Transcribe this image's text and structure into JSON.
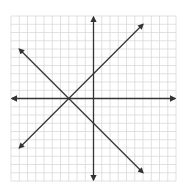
{
  "chart_data": {
    "type": "line",
    "title": "",
    "xlabel": "",
    "ylabel": "",
    "xlim": [
      -10,
      10
    ],
    "ylim": [
      -10,
      10
    ],
    "grid": true,
    "grid_step": 1,
    "axes_arrows": true,
    "series": [
      {
        "name": "line-1",
        "equation": "y = x + 3",
        "x": [
          -9,
          6
        ],
        "y": [
          -6,
          9
        ],
        "arrows": "both"
      },
      {
        "name": "line-2",
        "equation": "y = -x - 3",
        "x": [
          -9,
          6
        ],
        "y": [
          6,
          -9
        ],
        "arrows": "both"
      }
    ],
    "intersection": [
      -3,
      0
    ]
  },
  "style": {
    "grid_color": "#d4d4d4",
    "axis_color": "#333333",
    "line_color": "#333333",
    "background": "#ffffff"
  }
}
